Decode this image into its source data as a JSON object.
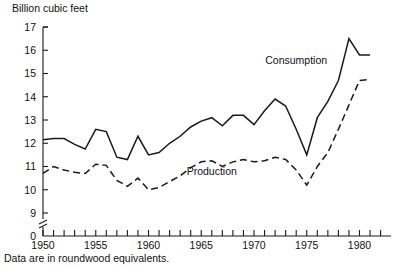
{
  "chart_data": {
    "type": "line",
    "title": "",
    "ylabel": "Billion cubic feet",
    "xlabel": "",
    "footnote": "Data are in roundwood equivalents.",
    "ylim": [
      9,
      17
    ],
    "y_ticks": [
      17,
      16,
      15,
      14,
      13,
      12,
      11,
      10,
      9
    ],
    "y_zero_label": "0",
    "y_axis_break": true,
    "xlim": [
      1950,
      1983
    ],
    "x_ticks_every": 1,
    "x_tick_labels": [
      "1950",
      "1955",
      "1960",
      "1965",
      "1970",
      "1975",
      "1980"
    ],
    "x_tick_label_years": [
      1950,
      1955,
      1960,
      1965,
      1970,
      1975,
      1980
    ],
    "grid": false,
    "legend_position": "inline-annotations",
    "x": [
      1950,
      1951,
      1952,
      1953,
      1954,
      1955,
      1956,
      1957,
      1958,
      1959,
      1960,
      1961,
      1962,
      1963,
      1964,
      1965,
      1966,
      1967,
      1968,
      1969,
      1970,
      1971,
      1972,
      1973,
      1974,
      1975,
      1976,
      1977,
      1978,
      1979,
      1980,
      1981
    ],
    "series": [
      {
        "name": "Consumption",
        "style": "solid",
        "label_year": 1974,
        "label_value": 15.4,
        "values": [
          12.15,
          12.2,
          12.2,
          11.95,
          11.75,
          12.6,
          12.5,
          11.4,
          11.3,
          12.3,
          11.5,
          11.6,
          12.0,
          12.3,
          12.7,
          12.95,
          13.1,
          12.75,
          13.2,
          13.2,
          12.8,
          13.4,
          13.9,
          13.6,
          12.6,
          11.5,
          13.1,
          13.8,
          14.7,
          16.5,
          15.8,
          15.8
        ]
      },
      {
        "name": "Production",
        "style": "dashed",
        "label_year": 1966,
        "label_value": 10.65,
        "values": [
          10.7,
          11.0,
          10.85,
          10.75,
          10.7,
          11.1,
          11.05,
          10.4,
          10.15,
          10.5,
          10.0,
          10.1,
          10.35,
          10.6,
          10.95,
          11.2,
          11.25,
          11.0,
          11.2,
          11.3,
          11.2,
          11.25,
          11.4,
          11.3,
          10.85,
          10.2,
          11.0,
          11.6,
          12.6,
          13.65,
          14.7,
          14.75
        ]
      }
    ]
  }
}
